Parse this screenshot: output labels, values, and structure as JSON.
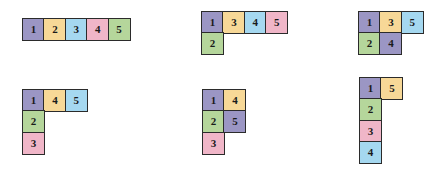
{
  "diagram": {
    "background_color": "#ffffff",
    "cell_size": 23,
    "border_color": "#2b2b2b",
    "label_color": "#1a1a1a",
    "palette": {
      "1": "#9b96c4",
      "2": "#b5d69b",
      "3": "#f7d897",
      "4_blue": "#a5d8f0",
      "4_pink": "#f0b6c8",
      "5_green": "#b5d69b",
      "purple": "#9b96c4",
      "green": "#b5d69b",
      "tan": "#f7d897",
      "blue": "#a5d8f0",
      "pink": "#f0b6c8"
    },
    "shapes": [
      {
        "name": "shape-1-straight-row",
        "x": 22,
        "y": 18,
        "cells": [
          {
            "label": "1",
            "col": 0,
            "row": 0,
            "color": "#9b96c4"
          },
          {
            "label": "2",
            "col": 1,
            "row": 0,
            "color": "#f7d897"
          },
          {
            "label": "3",
            "col": 2,
            "row": 0,
            "color": "#a5d8f0"
          },
          {
            "label": "4",
            "col": 3,
            "row": 0,
            "color": "#f0b6c8"
          },
          {
            "label": "5",
            "col": 4,
            "row": 0,
            "color": "#b5d69b"
          }
        ]
      },
      {
        "name": "shape-2-L-long",
        "x": 201,
        "y": 11,
        "cells": [
          {
            "label": "1",
            "col": 0,
            "row": 0,
            "color": "#9b96c4"
          },
          {
            "label": "3",
            "col": 1,
            "row": 0,
            "color": "#f7d897"
          },
          {
            "label": "4",
            "col": 2,
            "row": 0,
            "color": "#a5d8f0"
          },
          {
            "label": "5",
            "col": 3,
            "row": 0,
            "color": "#f0b6c8"
          },
          {
            "label": "2",
            "col": 0,
            "row": 1,
            "color": "#b5d69b"
          }
        ]
      },
      {
        "name": "shape-3-P-block",
        "x": 358,
        "y": 11,
        "cells": [
          {
            "label": "1",
            "col": 0,
            "row": 0,
            "color": "#9b96c4"
          },
          {
            "label": "3",
            "col": 1,
            "row": 0,
            "color": "#f7d897"
          },
          {
            "label": "5",
            "col": 2,
            "row": 0,
            "color": "#a5d8f0"
          },
          {
            "label": "2",
            "col": 0,
            "row": 1,
            "color": "#b5d69b"
          },
          {
            "label": "4",
            "col": 1,
            "row": 1,
            "color": "#9b96c4"
          }
        ]
      },
      {
        "name": "shape-4-V-corner",
        "x": 22,
        "y": 89,
        "cells": [
          {
            "label": "1",
            "col": 0,
            "row": 0,
            "color": "#9b96c4"
          },
          {
            "label": "4",
            "col": 1,
            "row": 0,
            "color": "#f7d897"
          },
          {
            "label": "5",
            "col": 2,
            "row": 0,
            "color": "#a5d8f0"
          },
          {
            "label": "2",
            "col": 0,
            "row": 1,
            "color": "#b5d69b"
          },
          {
            "label": "3",
            "col": 0,
            "row": 2,
            "color": "#f0b6c8"
          }
        ]
      },
      {
        "name": "shape-5-P-tall",
        "x": 202,
        "y": 89,
        "cells": [
          {
            "label": "1",
            "col": 0,
            "row": 0,
            "color": "#9b96c4"
          },
          {
            "label": "4",
            "col": 1,
            "row": 0,
            "color": "#f7d897"
          },
          {
            "label": "2",
            "col": 0,
            "row": 1,
            "color": "#b5d69b"
          },
          {
            "label": "5",
            "col": 1,
            "row": 1,
            "color": "#9b96c4"
          },
          {
            "label": "3",
            "col": 0,
            "row": 2,
            "color": "#f0b6c8"
          }
        ]
      },
      {
        "name": "shape-6-L-tall",
        "x": 359,
        "y": 77,
        "cells": [
          {
            "label": "1",
            "col": 0,
            "row": 0,
            "color": "#9b96c4"
          },
          {
            "label": "5",
            "col": 1,
            "row": 0,
            "color": "#f7d897"
          },
          {
            "label": "2",
            "col": 0,
            "row": 1,
            "color": "#b5d69b"
          },
          {
            "label": "3",
            "col": 0,
            "row": 2,
            "color": "#f0b6c8"
          },
          {
            "label": "4",
            "col": 0,
            "row": 3,
            "color": "#a5d8f0"
          }
        ]
      }
    ]
  }
}
